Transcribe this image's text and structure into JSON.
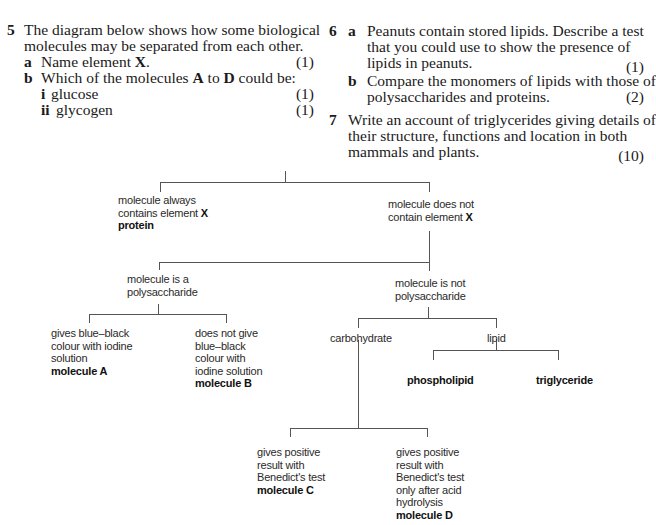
{
  "questions": {
    "q5": {
      "number": "5",
      "intro_line1": "The diagram below shows how some biological",
      "intro_line2": "molecules may be separated from each other.",
      "a": {
        "label": "a",
        "text_pre": "Name element ",
        "text_bold": "X",
        "text_post": ".",
        "marks": "(1)"
      },
      "b": {
        "label": "b",
        "text_pre": "Which of the molecules ",
        "bold1": "A",
        "text_mid": " to ",
        "bold2": "D",
        "text_post": " could be:",
        "i": {
          "label": "i",
          "text": "glucose",
          "marks": "(1)"
        },
        "ii": {
          "label": "ii",
          "text": "glycogen",
          "marks": "(1)"
        }
      }
    },
    "q6": {
      "number": "6",
      "a": {
        "label": "a",
        "line1": "Peanuts contain stored lipids. Describe a test",
        "line2": "that you could use to show the presence of",
        "line3": "lipids in peanuts.",
        "marks": "(1)"
      },
      "b": {
        "label": "b",
        "line1": "Compare the monomers of lipids with those of",
        "line2": "polysaccharides and proteins.",
        "marks": "(2)"
      }
    },
    "q7": {
      "number": "7",
      "line1": "Write an account of triglycerides giving details of",
      "line2": "their structure, functions and location in both",
      "line3": "mammals and plants.",
      "marks": "(10)"
    }
  },
  "diagram": {
    "contains_x": {
      "line1": "molecule always",
      "line2_pre": "contains element ",
      "line2_bold": "X",
      "result": "protein"
    },
    "no_x": {
      "line1": "molecule does not",
      "line2_pre": "contain element ",
      "line2_bold": "X"
    },
    "polysaccharide": {
      "line1": "molecule is a",
      "line2": "polysaccharide"
    },
    "not_polysaccharide": {
      "line1": "molecule is not",
      "line2": "polysaccharide"
    },
    "mol_a": {
      "line1": "gives blue–black",
      "line2": "colour with iodine",
      "line3": "solution",
      "result": "molecule A"
    },
    "mol_b": {
      "line1": "does not give",
      "line2": "blue–black",
      "line3": "colour with",
      "line4": "iodine solution",
      "result": "molecule B"
    },
    "carbohydrate": {
      "label": "carbohydrate"
    },
    "lipid": {
      "label": "lipid"
    },
    "phospholipid": {
      "label": "phospholipid"
    },
    "triglyceride": {
      "label": "triglyceride"
    },
    "mol_c": {
      "line1": "gives positive",
      "line2": "result with",
      "line3": "Benedict's test",
      "result": "molecule C"
    },
    "mol_d": {
      "line1": "gives positive",
      "line2": "result with",
      "line3": "Benedict's test",
      "line4": "only after acid",
      "line5": "hydrolysis",
      "result": "molecule D"
    }
  }
}
